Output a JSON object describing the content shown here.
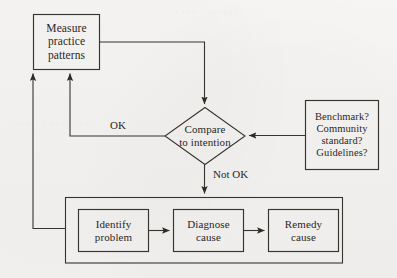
{
  "diagram": {
    "type": "flowchart",
    "stroke_color": "#37332f",
    "text_color": "#2a2724",
    "background_color": "#f5f4f2",
    "nodes": {
      "measure": {
        "shape": "rectangle",
        "lines": [
          "Measure",
          "practice",
          "patterns"
        ]
      },
      "compare": {
        "shape": "diamond",
        "lines": [
          "Compare",
          "to intention"
        ]
      },
      "benchmark": {
        "shape": "rectangle",
        "lines": [
          "Benchmark?",
          "Community",
          "standard?",
          "Guidelines?"
        ]
      },
      "identify": {
        "shape": "rectangle",
        "lines": [
          "Identify",
          "problem"
        ]
      },
      "diagnose": {
        "shape": "rectangle",
        "lines": [
          "Diagnose",
          "cause"
        ]
      },
      "remedy": {
        "shape": "rectangle",
        "lines": [
          "Remedy",
          "cause"
        ]
      }
    },
    "edge_labels": {
      "ok": "OK",
      "not_ok": "Not OK"
    },
    "ghost_text": {
      "line1": "show-through",
      "line2": "reverse page text"
    }
  }
}
